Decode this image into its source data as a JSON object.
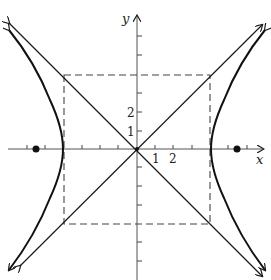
{
  "figure": {
    "title_fragment_visible": false,
    "axes": {
      "x_label": "x",
      "y_label": "y",
      "x_tick_labels": [
        "1",
        "2"
      ],
      "y_tick_labels": [
        "1",
        "2"
      ],
      "unit_px": 18.4,
      "origin_px": [
        137,
        149
      ]
    },
    "hyperbola": {
      "equation": "x^2/16 - y^2/16 = 1",
      "a": 4,
      "b": 4,
      "vertices": [
        [
          -4,
          0
        ],
        [
          4,
          0
        ]
      ],
      "foci": [
        [
          -5.66,
          0
        ],
        [
          5.66,
          0
        ]
      ],
      "asymptotes": [
        "y = x",
        "y = -x"
      ]
    },
    "fundamental_rectangle": {
      "corners": [
        [
          -4,
          4
        ],
        [
          4,
          4
        ],
        [
          4,
          -4
        ],
        [
          -4,
          -4
        ]
      ],
      "style": "dashed"
    },
    "colors": {
      "stroke": "#1a1a1a",
      "background": "#ffffff"
    }
  }
}
